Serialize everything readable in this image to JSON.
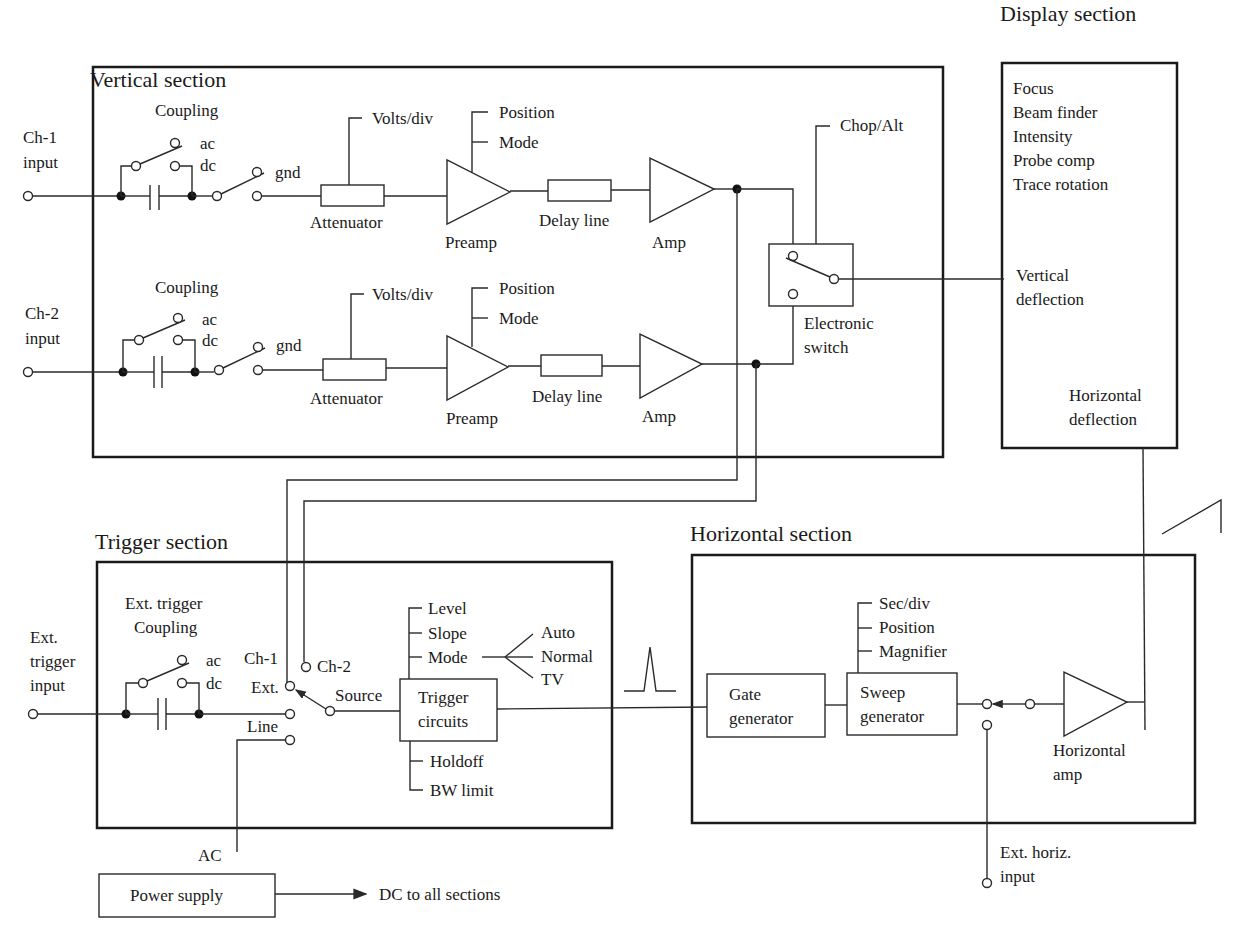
{
  "sections": {
    "vertical": {
      "title": "Vertical section"
    },
    "display": {
      "title": "Display section",
      "controls": [
        "Focus",
        "Beam finder",
        "Intensity",
        "Probe comp",
        "Trace rotation"
      ],
      "vertical_deflection": [
        "Vertical",
        "deflection"
      ],
      "horizontal_deflection": [
        "Horizontal",
        "deflection"
      ]
    },
    "trigger": {
      "title": "Trigger section"
    },
    "horizontal": {
      "title": "Horizontal section"
    }
  },
  "vertical_channels": [
    {
      "input": [
        "Ch-1",
        "input"
      ],
      "coupling_label": "Coupling",
      "coupling_options": [
        "ac",
        "dc",
        "gnd"
      ],
      "attenuator_control": "Volts/div",
      "attenuator_label": "Attenuator",
      "preamp_controls": [
        "Position",
        "Mode"
      ],
      "preamp_label": "Preamp",
      "delay_label": "Delay line",
      "amp_label": "Amp"
    },
    {
      "input": [
        "Ch-2",
        "input"
      ],
      "coupling_label": "Coupling",
      "coupling_options": [
        "ac",
        "dc",
        "gnd"
      ],
      "attenuator_control": "Volts/div",
      "attenuator_label": "Attenuator",
      "preamp_controls": [
        "Position",
        "Mode"
      ],
      "preamp_label": "Preamp",
      "delay_label": "Delay line",
      "amp_label": "Amp"
    }
  ],
  "electronic_switch": {
    "control": "Chop/Alt",
    "label": [
      "Electronic",
      "switch"
    ]
  },
  "trigger": {
    "ext_input": [
      "Ext.",
      "trigger",
      "input"
    ],
    "coupling_label": [
      "Ext. trigger",
      "Coupling"
    ],
    "coupling_options": [
      "ac",
      "dc"
    ],
    "source_options": [
      "Ch-1",
      "Ch-2",
      "Ext.",
      "Line"
    ],
    "source_label": "Source",
    "circuits_label": [
      "Trigger",
      "circuits"
    ],
    "controls_top": [
      "Level",
      "Slope",
      "Mode"
    ],
    "mode_options": [
      "Auto",
      "Normal",
      "TV"
    ],
    "controls_bottom": [
      "Holdoff",
      "BW limit"
    ]
  },
  "horizontal": {
    "gate_label": [
      "Gate",
      "generator"
    ],
    "sweep_label": [
      "Sweep",
      "generator"
    ],
    "sweep_controls": [
      "Sec/div",
      "Position",
      "Magnifier"
    ],
    "amp_label": [
      "Horizontal",
      "amp"
    ],
    "ext_input": [
      "Ext. horiz.",
      "input"
    ]
  },
  "power": {
    "ac_label": "AC",
    "supply_label": "Power supply",
    "output_label": "DC to all sections"
  }
}
